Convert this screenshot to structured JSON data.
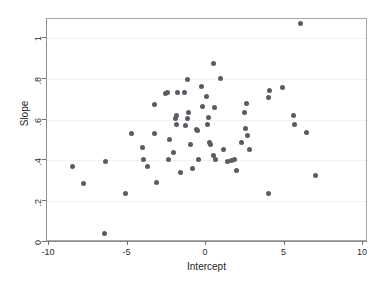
{
  "chart_data": {
    "type": "scatter",
    "title": "",
    "xlabel": "Intercept",
    "ylabel": "Slope",
    "xlim": [
      -10,
      10
    ],
    "ylim": [
      0,
      1.1
    ],
    "xticks": [
      -10,
      -5,
      0,
      5,
      10
    ],
    "xticklabels": [
      "-10",
      "-5",
      "0",
      "5",
      "10"
    ],
    "yticks": [
      0,
      0.2,
      0.4,
      0.6,
      0.8,
      1
    ],
    "yticklabels": [
      "0",
      ".2",
      ".4",
      ".6",
      ".8",
      "1"
    ],
    "grid": "horizontal",
    "legend": null,
    "marker_color": "#5b5b63",
    "frame_color": "#a8a8a8",
    "n_points": 73,
    "points": [
      [
        -8.5,
        0.368
      ],
      [
        -7.8,
        0.285
      ],
      [
        -6.45,
        0.043
      ],
      [
        -6.4,
        0.397
      ],
      [
        -5.1,
        0.238
      ],
      [
        -4.75,
        0.53
      ],
      [
        -4.05,
        0.462
      ],
      [
        -3.95,
        0.405
      ],
      [
        -3.75,
        0.372
      ],
      [
        -3.3,
        0.673
      ],
      [
        -3.25,
        0.533
      ],
      [
        -3.15,
        0.292
      ],
      [
        -2.6,
        0.73
      ],
      [
        -2.45,
        0.735
      ],
      [
        -2.4,
        0.403
      ],
      [
        -2.3,
        0.503
      ],
      [
        -2.1,
        0.437
      ],
      [
        -1.95,
        0.605
      ],
      [
        -1.9,
        0.62
      ],
      [
        -1.85,
        0.575
      ],
      [
        -1.8,
        0.733
      ],
      [
        -1.65,
        0.343
      ],
      [
        -1.35,
        0.733
      ],
      [
        -1.3,
        0.572
      ],
      [
        -1.2,
        0.795
      ],
      [
        -1.15,
        0.607
      ],
      [
        -1.1,
        0.637
      ],
      [
        -1.0,
        0.48
      ],
      [
        -0.85,
        0.358
      ],
      [
        -0.6,
        0.552
      ],
      [
        -0.55,
        0.545
      ],
      [
        -0.5,
        0.403
      ],
      [
        -0.3,
        0.762
      ],
      [
        -0.2,
        0.664
      ],
      [
        0.05,
        0.711
      ],
      [
        0.1,
        0.575
      ],
      [
        0.15,
        0.612
      ],
      [
        0.25,
        0.487
      ],
      [
        0.3,
        0.478
      ],
      [
        0.45,
        0.873
      ],
      [
        0.5,
        0.424
      ],
      [
        0.55,
        0.66
      ],
      [
        0.6,
        0.405
      ],
      [
        0.95,
        0.803
      ],
      [
        1.1,
        0.452
      ],
      [
        1.35,
        0.397
      ],
      [
        1.65,
        0.4
      ],
      [
        1.8,
        0.402
      ],
      [
        1.95,
        0.352
      ],
      [
        2.25,
        0.487
      ],
      [
        2.45,
        0.637
      ],
      [
        2.5,
        0.555
      ],
      [
        2.6,
        0.677
      ],
      [
        2.65,
        0.523
      ],
      [
        2.75,
        0.452
      ],
      [
        3.95,
        0.71
      ],
      [
        4.05,
        0.742
      ],
      [
        4.0,
        0.238
      ],
      [
        4.85,
        0.758
      ],
      [
        5.55,
        0.618
      ],
      [
        5.65,
        0.577
      ],
      [
        6.05,
        1.072
      ],
      [
        6.4,
        0.535
      ],
      [
        6.95,
        0.325
      ]
    ]
  }
}
